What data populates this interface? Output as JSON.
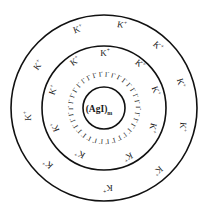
{
  "diagram": {
    "title": "",
    "type": "colloidal micelle structure",
    "core": {
      "label": "(AgI)",
      "subscript": "m"
    },
    "adsorbed_ion": {
      "label": "I",
      "charge": "-",
      "count": 34
    },
    "counter_ion": {
      "label": "K",
      "charge": "+"
    },
    "inner_counter_ions": [
      {
        "x": 105,
        "y": 53,
        "angle": 0
      },
      {
        "x": 75,
        "y": 61,
        "angle": -35
      },
      {
        "x": 140,
        "y": 64,
        "angle": 40
      },
      {
        "x": 53,
        "y": 90,
        "angle": -70
      },
      {
        "x": 156,
        "y": 91,
        "angle": 70
      },
      {
        "x": 55,
        "y": 127,
        "angle": -110
      },
      {
        "x": 153,
        "y": 128,
        "angle": 105
      },
      {
        "x": 80,
        "y": 154,
        "angle": -150
      },
      {
        "x": 128,
        "y": 157,
        "angle": 155
      }
    ],
    "outer_counter_ions": [
      {
        "x": 78,
        "y": 29,
        "angle": -20
      },
      {
        "x": 122,
        "y": 25,
        "angle": 10
      },
      {
        "x": 158,
        "y": 46,
        "angle": 45
      },
      {
        "x": 38,
        "y": 65,
        "angle": -55
      },
      {
        "x": 181,
        "y": 83,
        "angle": 75
      },
      {
        "x": 28,
        "y": 116,
        "angle": -90
      },
      {
        "x": 183,
        "y": 127,
        "angle": 95
      },
      {
        "x": 48,
        "y": 164,
        "angle": -135
      },
      {
        "x": 158,
        "y": 171,
        "angle": 140
      },
      {
        "x": 108,
        "y": 188,
        "angle": 180
      }
    ],
    "circles": {
      "center_x": 104,
      "center_y": 108,
      "core_r": 21,
      "inner_r": 62,
      "outer_r": 93
    },
    "colors": {
      "line": "#111111",
      "text": "#1a1a1a",
      "background": "#ffffff"
    }
  }
}
